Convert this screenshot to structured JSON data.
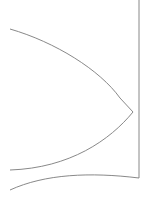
{
  "diagram": {
    "background": "#ffffff",
    "stroke_color": "#7a7a7a",
    "shapes": [
      {
        "name": "upper-curve",
        "from": [
          10,
          29
        ],
        "to": [
          133,
          112
        ]
      },
      {
        "name": "lower-curve",
        "from": [
          133,
          112
        ],
        "to": [
          10,
          170
        ]
      },
      {
        "name": "vertical-edge",
        "from": [
          139,
          0
        ],
        "to": [
          139,
          178
        ]
      },
      {
        "name": "bottom-curve",
        "from": [
          10,
          190
        ],
        "to": [
          139,
          178
        ]
      }
    ]
  }
}
